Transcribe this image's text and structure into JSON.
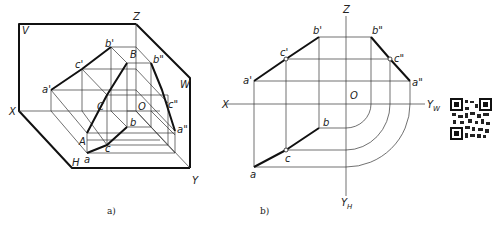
{
  "figure_a": {
    "caption": "a)",
    "planes": {
      "V": "V",
      "H": "H",
      "W": "W"
    },
    "axes": {
      "X": "X",
      "Y": "Y",
      "Z": "Z",
      "origin": "O"
    },
    "points_space": {
      "A": "A",
      "B": "B",
      "C": "C"
    },
    "points_h": {
      "a": "a",
      "b": "b",
      "c": "c"
    },
    "points_v": {
      "a": "a'",
      "b": "b'",
      "c": "c'"
    },
    "points_w": {
      "a": "a\"",
      "b": "b\"",
      "c": "c\""
    }
  },
  "figure_b": {
    "caption": "b)",
    "axes": {
      "X": "X",
      "Z": "Z",
      "YW": "Y",
      "YW_sub": "W",
      "YH": "Y",
      "YH_sub": "H",
      "origin": "O"
    },
    "points_h": {
      "a": "a",
      "b": "b",
      "c": "c"
    },
    "points_v": {
      "a": "a'",
      "b": "b'",
      "c": "c'"
    },
    "points_w": {
      "a": "a\"",
      "b": "b\"",
      "c": "c\""
    }
  },
  "qr_code": "qr-code"
}
